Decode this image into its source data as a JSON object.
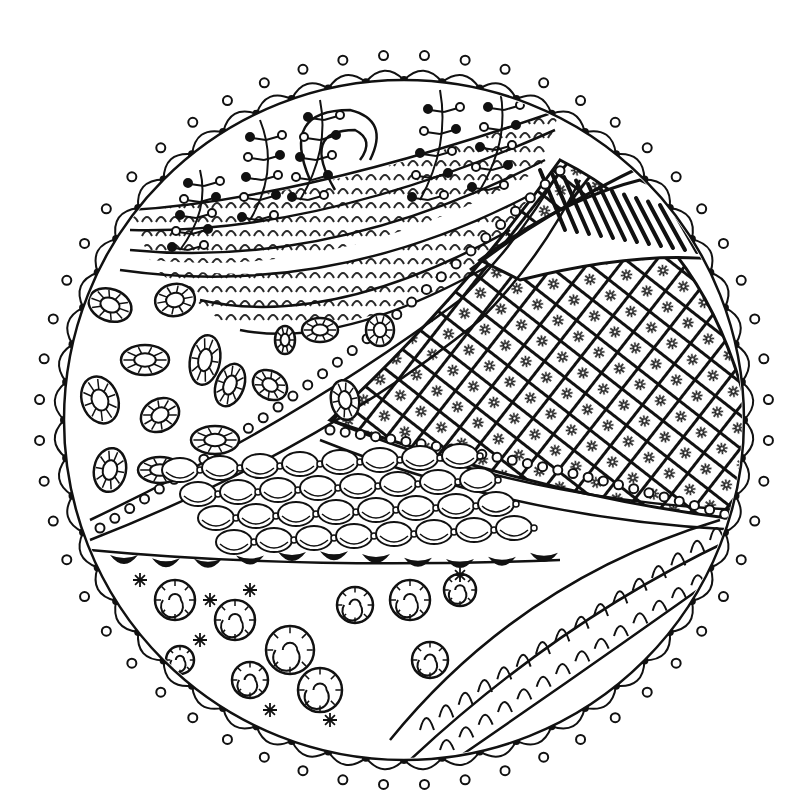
{
  "artwork": {
    "kind": "zentangle-mandala-drawing",
    "palette": {
      "ink": "#111111",
      "paper": "#ffffff"
    },
    "circle": {
      "cx": 404,
      "cy": 420,
      "r": 340
    },
    "border_motif": "scalloped-loops-with-dots",
    "regions": [
      {
        "name": "top-left-vine-sprigs",
        "pattern": "branching stems with open and filled dots"
      },
      {
        "name": "top-curl-bands",
        "pattern": "curving banded stripes with spiral end"
      },
      {
        "name": "top-right-feather",
        "pattern": "elongated parallel loops with midrib"
      },
      {
        "name": "right-lattice",
        "pattern": "diagonal grid with star-flowers in cells"
      },
      {
        "name": "left-donut-ovals",
        "pattern": "segmented oval rings with pin-dots"
      },
      {
        "name": "center-pearl-band",
        "pattern": "chain of pearls / beads"
      },
      {
        "name": "center-scale-links",
        "pattern": "overlapping linked ovals"
      },
      {
        "name": "black-drop-band",
        "pattern": "black teardrop shapes"
      },
      {
        "name": "bottom-left-spirals",
        "pattern": "segmented spiral snails with asterisks"
      },
      {
        "name": "bottom-right-leaves",
        "pattern": "leaf bands with U-loops and ladder veins"
      }
    ]
  }
}
